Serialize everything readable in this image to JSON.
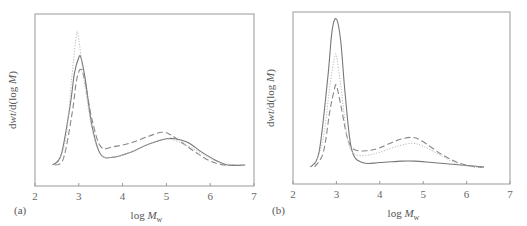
{
  "chart_data": [
    {
      "panel": "(a)",
      "type": "line",
      "title": "",
      "xlabel": "log M_w",
      "ylabel": "dwt/d(log M)",
      "xlim": [
        2,
        7
      ],
      "xticks": [
        "2",
        "3",
        "4",
        "5",
        "6",
        "7"
      ],
      "yticks": [],
      "grid": false,
      "legend": null,
      "units_note": "y values are relative (arbitrary units, 0 = baseline, 1 = tallest peak)",
      "series": [
        {
          "name": "solid",
          "style": "solid",
          "x": [
            2.4,
            2.6,
            2.8,
            2.9,
            3.0,
            3.05,
            3.15,
            3.3,
            3.5,
            3.8,
            4.2,
            4.6,
            5.0,
            5.2,
            5.5,
            5.8,
            6.1,
            6.4,
            6.8
          ],
          "y": [
            0.0,
            0.08,
            0.45,
            0.7,
            0.82,
            0.82,
            0.65,
            0.3,
            0.08,
            0.06,
            0.1,
            0.16,
            0.2,
            0.2,
            0.17,
            0.1,
            0.04,
            0.0,
            0.0
          ]
        },
        {
          "name": "dashed",
          "style": "dashed",
          "x": [
            2.45,
            2.65,
            2.85,
            2.95,
            3.05,
            3.15,
            3.3,
            3.5,
            3.8,
            4.2,
            4.6,
            4.9,
            5.1,
            5.4,
            5.7,
            6.0,
            6.3,
            6.6
          ],
          "y": [
            0.0,
            0.05,
            0.4,
            0.65,
            0.73,
            0.62,
            0.35,
            0.14,
            0.14,
            0.17,
            0.22,
            0.25,
            0.23,
            0.16,
            0.09,
            0.03,
            0.0,
            0.0
          ]
        },
        {
          "name": "dotted",
          "style": "dotted",
          "x": [
            2.5,
            2.7,
            2.85,
            2.95,
            3.0,
            3.1,
            3.3,
            3.5,
            3.8,
            4.2,
            4.6,
            5.0,
            5.4,
            5.8,
            6.2,
            6.6
          ],
          "y": [
            0.0,
            0.2,
            0.7,
            1.0,
            0.96,
            0.7,
            0.28,
            0.08,
            0.06,
            0.1,
            0.16,
            0.2,
            0.16,
            0.09,
            0.02,
            0.0
          ]
        }
      ]
    },
    {
      "panel": "(b)",
      "type": "line",
      "title": "",
      "xlabel": "log M_w",
      "ylabel": "dwt/d(log M)",
      "xlim": [
        2,
        7
      ],
      "xticks": [
        "2",
        "3",
        "4",
        "5",
        "6",
        "7"
      ],
      "yticks": [],
      "grid": false,
      "legend": null,
      "units_note": "y values are relative (arbitrary units, 0 = baseline, 1 = tallest peak)",
      "series": [
        {
          "name": "solid",
          "style": "solid",
          "x": [
            2.4,
            2.6,
            2.8,
            2.9,
            3.0,
            3.1,
            3.2,
            3.35,
            3.6,
            4.0,
            4.5,
            4.8,
            5.2,
            5.6,
            6.0,
            6.4
          ],
          "y": [
            0.0,
            0.1,
            0.6,
            0.92,
            1.0,
            0.85,
            0.5,
            0.12,
            0.03,
            0.03,
            0.04,
            0.04,
            0.03,
            0.02,
            0.01,
            0.0
          ]
        },
        {
          "name": "dashed",
          "style": "dashed",
          "x": [
            2.5,
            2.7,
            2.85,
            2.95,
            3.0,
            3.1,
            3.25,
            3.4,
            3.7,
            4.0,
            4.4,
            4.75,
            5.0,
            5.4,
            5.8,
            6.2,
            6.4
          ],
          "y": [
            0.0,
            0.1,
            0.38,
            0.52,
            0.55,
            0.42,
            0.2,
            0.12,
            0.11,
            0.13,
            0.18,
            0.2,
            0.17,
            0.09,
            0.03,
            0.0,
            0.0
          ]
        },
        {
          "name": "dotted",
          "style": "dotted",
          "x": [
            2.5,
            2.7,
            2.85,
            2.95,
            3.0,
            3.1,
            3.25,
            3.4,
            3.7,
            4.0,
            4.4,
            4.75,
            5.0,
            5.4,
            5.8,
            6.2,
            6.4
          ],
          "y": [
            0.0,
            0.2,
            0.55,
            0.73,
            0.75,
            0.55,
            0.2,
            0.09,
            0.08,
            0.1,
            0.14,
            0.16,
            0.14,
            0.08,
            0.02,
            0.0,
            0.0
          ]
        }
      ]
    }
  ],
  "panels": [
    {
      "label": "(a)",
      "xlabel_text": "log ",
      "xlabel_var": "M",
      "xlabel_sub": "w",
      "ylabel": "dwt/d(log M)"
    },
    {
      "label": "(b)",
      "xlabel_text": "log ",
      "xlabel_var": "M",
      "xlabel_sub": "w",
      "ylabel": "dwt/d(log M)"
    }
  ]
}
